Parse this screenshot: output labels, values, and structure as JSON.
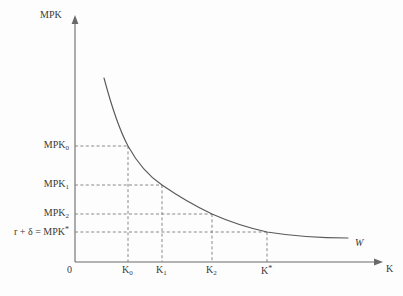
{
  "figure": {
    "background_color": "#fdfdfd",
    "ink_color": "#555555",
    "text_color": "#3a3a3a"
  },
  "axes": {
    "y_axis_label": "MPK",
    "x_axis_label": "K",
    "origin_label": "0"
  },
  "curve": {
    "label": "W",
    "label_style": "italic"
  },
  "y_ticks": [
    {
      "text_html": "MPK<sub>0</sub>",
      "plain": "MPK0"
    },
    {
      "text_html": "MPK<sub>1</sub>",
      "plain": "MPK1"
    },
    {
      "text_html": "MPK<sub>2</sub>",
      "plain": "MPK2"
    },
    {
      "text_html": "r + &delta; = MPK<sup>*</sup>",
      "plain": "r + δ = MPK*"
    }
  ],
  "x_ticks": [
    {
      "text_html": "K<sub>0</sub>",
      "plain": "K0"
    },
    {
      "text_html": "K<sub>1</sub>",
      "plain": "K1"
    },
    {
      "text_html": "K<sub>2</sub>",
      "plain": "K2"
    },
    {
      "text_html": "K<sup>*</sup>",
      "plain": "K*"
    }
  ],
  "chart_data": {
    "type": "line",
    "title": "",
    "xlabel": "K",
    "ylabel": "MPK",
    "grid": false,
    "legend": "none",
    "series": [
      {
        "name": "W",
        "description": "Downward-sloping marginal product of capital schedule (convex, hyperbolic)",
        "x": [
          104,
          112,
          120,
          128,
          138,
          150,
          162,
          176,
          190,
          212,
          232,
          250,
          267,
          290,
          315,
          348
        ],
        "y": [
          78,
          95,
          112,
          146,
          160,
          173,
          185,
          194,
          201,
          214,
          221,
          227,
          232,
          235,
          237,
          238
        ]
      }
    ],
    "annotations": [
      {
        "label": "MPK0 at K0",
        "x": 128,
        "y": 146
      },
      {
        "label": "MPK1 at K1",
        "x": 162,
        "y": 185
      },
      {
        "label": "MPK2 at K2",
        "x": 212,
        "y": 214
      },
      {
        "label": "r + δ = MPK* at K*",
        "x": 267,
        "y": 232
      }
    ],
    "axis_pixel_ranges": {
      "x_axis_y": 262,
      "y_axis_x": 75,
      "x_axis_end": 383,
      "y_axis_top": 18
    }
  }
}
